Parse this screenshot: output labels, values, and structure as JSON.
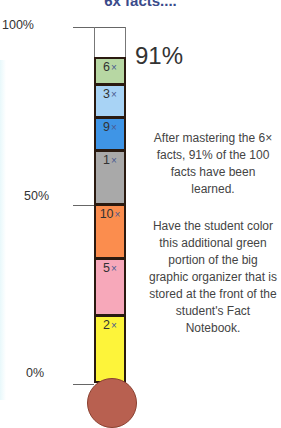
{
  "title": "6x facts....",
  "axis": {
    "top": "100%",
    "mid": "50%",
    "bottom": "0%"
  },
  "current_percent": "91%",
  "segments": [
    {
      "label": "6",
      "suffix": "×",
      "color": "#b7d7a3",
      "top": 57,
      "height": 28
    },
    {
      "label": "3",
      "suffix": "×",
      "color": "#a8d3f5",
      "top": 84,
      "height": 34
    },
    {
      "label": "9",
      "suffix": "×",
      "color": "#3f95e6",
      "top": 117,
      "height": 34
    },
    {
      "label": "1",
      "suffix": "×",
      "color": "#a9a9a9",
      "top": 150,
      "height": 55
    },
    {
      "label": "10",
      "suffix": "×",
      "color": "#fb8d4e",
      "top": 204,
      "height": 55
    },
    {
      "label": "5",
      "suffix": "×",
      "color": "#f7a8ba",
      "top": 258,
      "height": 58
    },
    {
      "label": "2",
      "suffix": "×",
      "color": "#fdf43a",
      "top": 315,
      "height": 68
    }
  ],
  "description": {
    "p1": "After mastering the 6× facts, 91% of the 100 facts have been learned.",
    "p2": "Have the student color this additional green portion of the big graphic organizer that is  stored at the front of the student's Fact Notebook."
  },
  "chart_data": {
    "type": "bar",
    "title": "6x facts....",
    "categories": [
      "2x",
      "5x",
      "10x",
      "1x",
      "9x",
      "3x",
      "6x"
    ],
    "values": [
      19,
      17,
      16,
      16,
      9,
      9,
      5
    ],
    "cumulative_total": 91,
    "ylabel": "Percent of facts learned",
    "ylim": [
      0,
      100
    ],
    "tick_labels": [
      "0%",
      "50%",
      "100%"
    ],
    "annotation": "91%"
  }
}
